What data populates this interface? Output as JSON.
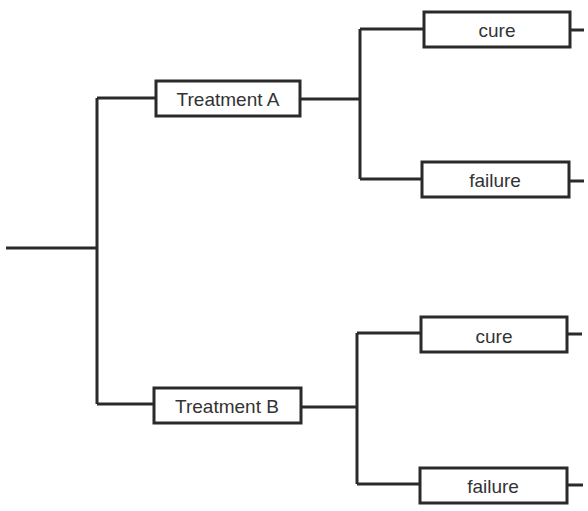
{
  "diagram": {
    "type": "decision-tree",
    "root": {
      "label": ""
    },
    "branches": [
      {
        "label": "Treatment A",
        "outcomes": [
          {
            "label": "cure"
          },
          {
            "label": "failure"
          }
        ]
      },
      {
        "label": "Treatment B",
        "outcomes": [
          {
            "label": "cure"
          },
          {
            "label": "failure"
          }
        ]
      }
    ]
  },
  "colors": {
    "line": "#2a2a2a",
    "text": "#333333",
    "background": "#ffffff"
  }
}
